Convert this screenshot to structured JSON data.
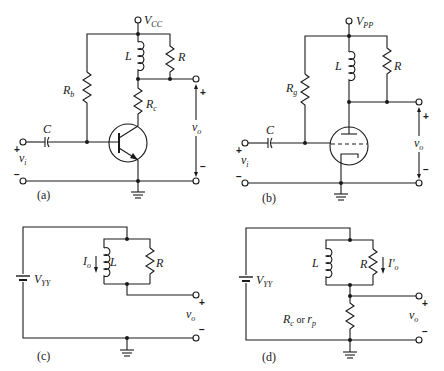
{
  "figure": {
    "panels": [
      {
        "id": "a",
        "caption": "(a)",
        "supply": {
          "main": "V",
          "sub": "CC"
        },
        "labels": {
          "inductor": "L",
          "resistor": "R",
          "bias_resistor_main": "R",
          "bias_resistor_sub": "b",
          "load_resistor_main": "R",
          "load_resistor_sub": "c",
          "capacitor": "C",
          "input_main": "v",
          "input_sub": "i",
          "output_main": "v",
          "output_sub": "o"
        },
        "device": "npn-transistor"
      },
      {
        "id": "b",
        "caption": "(b)",
        "supply": {
          "main": "V",
          "sub": "PP"
        },
        "labels": {
          "inductor": "L",
          "resistor": "R",
          "bias_resistor_main": "R",
          "bias_resistor_sub": "g",
          "capacitor": "C",
          "input_main": "v",
          "input_sub": "i",
          "output_main": "v",
          "output_sub": "o"
        },
        "device": "triode-vacuum-tube"
      },
      {
        "id": "c",
        "caption": "(c)",
        "supply": {
          "main": "V",
          "sub": "YY"
        },
        "labels": {
          "inductor": "L",
          "resistor": "R",
          "current_main": "I",
          "current_sub": "o",
          "output_main": "v",
          "output_sub": "o"
        }
      },
      {
        "id": "d",
        "caption": "(d)",
        "supply": {
          "main": "V",
          "sub": "YY"
        },
        "labels": {
          "inductor": "L",
          "resistor": "R",
          "current_main": "I'",
          "current_sub": "o",
          "series_main": "R",
          "series_sub": "c",
          "series_or": " or ",
          "series_alt_main": "r",
          "series_alt_sub": "p",
          "output_main": "v",
          "output_sub": "o"
        }
      }
    ],
    "signs": {
      "plus": "+",
      "minus": "−"
    }
  }
}
